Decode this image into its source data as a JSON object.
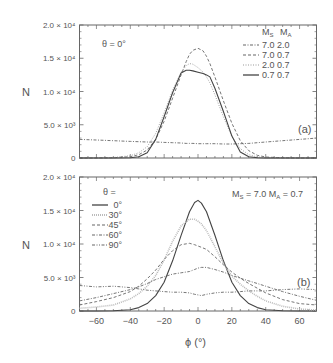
{
  "figure": {
    "ylabel": "N",
    "xlabel": "ϕ (°)",
    "yticks": [
      {
        "value": 0,
        "label": "0"
      },
      {
        "value": 5000,
        "label": "5.0 × 10³"
      },
      {
        "value": 10000,
        "label": "1.0 × 10⁴"
      },
      {
        "value": 15000,
        "label": "1.5 × 10⁴"
      },
      {
        "value": 20000,
        "label": "2.0 × 10⁴"
      }
    ],
    "xticks": [
      -60,
      -40,
      -20,
      0,
      20,
      40,
      60
    ],
    "xtick_labels": [
      "−60",
      "−40",
      "−20",
      "0",
      "20",
      "40",
      "60"
    ]
  },
  "chart_data": [
    {
      "type": "line",
      "panel": "(a)",
      "title": "",
      "annotation": "θ = 0°",
      "xlabel": "ϕ (°)",
      "ylabel": "N",
      "xlim": [
        -70,
        70
      ],
      "ylim": [
        0,
        20000
      ],
      "grid": false,
      "legend_position": "upper right",
      "legend_header": [
        "M_S",
        "M_A"
      ],
      "x": [
        -70,
        -60,
        -50,
        -40,
        -35,
        -30,
        -25,
        -20,
        -15,
        -10,
        -7,
        -5,
        -3,
        0,
        3,
        5,
        7,
        10,
        15,
        20,
        25,
        30,
        35,
        40,
        50,
        60,
        70
      ],
      "series": [
        {
          "name": "7.0 2.0",
          "ms": "7.0",
          "ma": "2.0",
          "style": "dashdot",
          "values": [
            2800,
            2700,
            2600,
            2500,
            2450,
            2400,
            2400,
            2350,
            2300,
            2250,
            2200,
            2200,
            2200,
            2150,
            2150,
            2150,
            2150,
            2150,
            2100,
            2100,
            2150,
            2200,
            2300,
            2400,
            2600,
            2800,
            3000
          ]
        },
        {
          "name": "7.0 0.7",
          "ms": "7.0",
          "ma": "0.7",
          "style": "dashed",
          "values": [
            0,
            0,
            50,
            200,
            500,
            1200,
            2800,
            5500,
            9000,
            12500,
            14500,
            15600,
            16200,
            16500,
            16100,
            15300,
            14200,
            12200,
            8600,
            5200,
            2600,
            1100,
            400,
            150,
            30,
            0,
            0
          ]
        },
        {
          "name": "2.0 0.7",
          "ms": "2.0",
          "ma": "0.7",
          "style": "dotted",
          "values": [
            0,
            0,
            80,
            350,
            800,
            1700,
            3700,
            6800,
            10200,
            12900,
            13900,
            14200,
            14100,
            13600,
            12900,
            12200,
            11300,
            9500,
            6200,
            3200,
            1400,
            500,
            150,
            50,
            0,
            0,
            0
          ]
        },
        {
          "name": "0.7 0.7",
          "ms": "0.7",
          "ma": "0.7",
          "style": "solid",
          "values": [
            0,
            0,
            0,
            50,
            200,
            800,
            2800,
            6200,
            9800,
            12800,
            13200,
            13200,
            13100,
            12900,
            12700,
            12500,
            12200,
            10500,
            7000,
            3300,
            900,
            200,
            50,
            0,
            0,
            0,
            0
          ]
        }
      ]
    },
    {
      "type": "line",
      "panel": "(b)",
      "title": "",
      "annotation": "M_S = 7.0  M_A = 0.7",
      "legend_title": "θ =",
      "xlabel": "ϕ (°)",
      "ylabel": "N",
      "xlim": [
        -70,
        70
      ],
      "ylim": [
        0,
        20000
      ],
      "grid": false,
      "legend_position": "upper left",
      "x": [
        -70,
        -60,
        -50,
        -40,
        -35,
        -30,
        -25,
        -20,
        -15,
        -10,
        -5,
        -2,
        0,
        2,
        5,
        10,
        15,
        20,
        25,
        30,
        35,
        40,
        50,
        60,
        70
      ],
      "series": [
        {
          "name": "0°",
          "theta": "0°",
          "style": "solid",
          "color": "#444444",
          "values": [
            0,
            0,
            50,
            200,
            500,
            1100,
            2300,
            4300,
            7500,
            11300,
            14800,
            16200,
            16500,
            16100,
            14800,
            11300,
            7500,
            4300,
            2300,
            1100,
            500,
            200,
            50,
            0,
            0
          ]
        },
        {
          "name": "30°",
          "theta": "30°",
          "style": "dotted-light",
          "color": "#bbbbbb",
          "values": [
            400,
            600,
            900,
            1800,
            2600,
            3700,
            5300,
            7600,
            10400,
            12700,
            13700,
            13700,
            13400,
            13000,
            12000,
            9600,
            7100,
            5200,
            4000,
            3000,
            2200,
            1500,
            700,
            300,
            150
          ]
        },
        {
          "name": "45°",
          "theta": "45°",
          "style": "dashed",
          "color": "#666666",
          "values": [
            900,
            1400,
            2000,
            2900,
            3700,
            4800,
            6100,
            7700,
            9000,
            9900,
            10100,
            9900,
            9700,
            9500,
            9200,
            8100,
            6900,
            5800,
            4900,
            4100,
            3400,
            2700,
            1700,
            1100,
            900
          ]
        },
        {
          "name": "60°",
          "theta": "60°",
          "style": "dashdot",
          "color": "#666666",
          "values": [
            1500,
            2000,
            2600,
            3200,
            3600,
            4100,
            4700,
            5100,
            5500,
            5700,
            5900,
            6200,
            6400,
            6500,
            6500,
            6200,
            5800,
            5300,
            4900,
            4500,
            4100,
            3700,
            2900,
            2200,
            1600
          ]
        },
        {
          "name": "90°",
          "theta": "90°",
          "style": "dashdotdot",
          "color": "#666666",
          "values": [
            3800,
            3600,
            3700,
            3500,
            3300,
            3100,
            3000,
            2900,
            2800,
            2800,
            2700,
            2500,
            2400,
            2300,
            2500,
            2700,
            2800,
            2800,
            2900,
            3000,
            3000,
            3000,
            3200,
            3300,
            3200
          ]
        }
      ]
    }
  ]
}
